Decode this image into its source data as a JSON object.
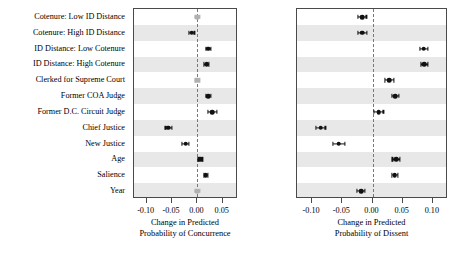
{
  "chart_data": {
    "type": "scatter",
    "title": "",
    "categories": [
      "Cotenure: Low ID Distance",
      "Cotenure: High ID Distance",
      "ID Distance: Low Cotenure",
      "ID Distance: High Cotenure",
      "Clerked for Supreme Court",
      "Former COA Judge",
      "Former D.C. Circuit Judge",
      "Chief Justice",
      "New Justice",
      "Age",
      "Salience",
      "Year"
    ],
    "panels": [
      {
        "name": "concurrence",
        "xlabel_lines": [
          "Change in Predicted",
          "Probability of Concurrence"
        ],
        "xlim": [
          -0.125,
          0.08
        ],
        "xticks": [
          -0.1,
          -0.05,
          0.0,
          0.05
        ],
        "xticklabels": [
          "-0.10",
          "-0.05",
          "0.00",
          "0.05"
        ],
        "zero_reference": 0.0,
        "points": [
          {
            "category": "Cotenure: Low ID Distance",
            "estimate": 0.0,
            "ci_low": -0.004,
            "ci_high": 0.004,
            "significant": false
          },
          {
            "category": "Cotenure: High ID Distance",
            "estimate": -0.011,
            "ci_low": -0.016,
            "ci_high": -0.006,
            "significant": true
          },
          {
            "category": "ID Distance: Low Cotenure",
            "estimate": 0.021,
            "ci_low": 0.016,
            "ci_high": 0.026,
            "significant": true
          },
          {
            "category": "ID Distance: High Cotenure",
            "estimate": 0.018,
            "ci_low": 0.013,
            "ci_high": 0.023,
            "significant": true
          },
          {
            "category": "Clerked for Supreme Court",
            "estimate": 0.0,
            "ci_low": -0.004,
            "ci_high": 0.004,
            "significant": false
          },
          {
            "category": "Former COA Judge",
            "estimate": 0.021,
            "ci_low": 0.016,
            "ci_high": 0.026,
            "significant": true
          },
          {
            "category": "Former D.C. Circuit Judge",
            "estimate": 0.029,
            "ci_low": 0.02,
            "ci_high": 0.038,
            "significant": true
          },
          {
            "category": "Chief Justice",
            "estimate": -0.057,
            "ci_low": -0.063,
            "ci_high": -0.051,
            "significant": true
          },
          {
            "category": "New Justice",
            "estimate": -0.023,
            "ci_low": -0.03,
            "ci_high": -0.016,
            "significant": true
          },
          {
            "category": "Age",
            "estimate": 0.006,
            "ci_low": 0.002,
            "ci_high": 0.01,
            "significant": true
          },
          {
            "category": "Salience",
            "estimate": 0.016,
            "ci_low": 0.012,
            "ci_high": 0.02,
            "significant": true
          },
          {
            "category": "Year",
            "estimate": 0.0,
            "ci_low": -0.004,
            "ci_high": 0.004,
            "significant": false
          }
        ]
      },
      {
        "name": "dissent",
        "xlabel_lines": [
          "Change in Predicted",
          "Probability of Dissent"
        ],
        "xlim": [
          -0.125,
          0.125
        ],
        "xticks": [
          -0.1,
          -0.05,
          0.0,
          0.05,
          0.1
        ],
        "xticklabels": [
          "-0.10",
          "-0.05",
          "0.00",
          "0.05",
          "0.10"
        ],
        "zero_reference": 0.0,
        "points": [
          {
            "category": "Cotenure: Low ID Distance",
            "estimate": -0.017,
            "ci_low": -0.024,
            "ci_high": -0.01,
            "significant": true
          },
          {
            "category": "Cotenure: High ID Distance",
            "estimate": -0.017,
            "ci_low": -0.024,
            "ci_high": -0.009,
            "significant": true
          },
          {
            "category": "ID Distance: Low Cotenure",
            "estimate": 0.085,
            "ci_low": 0.078,
            "ci_high": 0.092,
            "significant": true
          },
          {
            "category": "ID Distance: High Cotenure",
            "estimate": 0.086,
            "ci_low": 0.08,
            "ci_high": 0.092,
            "significant": true
          },
          {
            "category": "Clerked for Supreme Court",
            "estimate": 0.028,
            "ci_low": 0.02,
            "ci_high": 0.036,
            "significant": true
          },
          {
            "category": "Former COA Judge",
            "estimate": 0.038,
            "ci_low": 0.032,
            "ci_high": 0.044,
            "significant": true
          },
          {
            "category": "Former D.C. Circuit Judge",
            "estimate": 0.01,
            "ci_low": 0.002,
            "ci_high": 0.018,
            "significant": true
          },
          {
            "category": "Chief Justice",
            "estimate": -0.086,
            "ci_low": -0.094,
            "ci_high": -0.078,
            "significant": true
          },
          {
            "category": "New Justice",
            "estimate": -0.056,
            "ci_low": -0.066,
            "ci_high": -0.046,
            "significant": true
          },
          {
            "category": "Age",
            "estimate": 0.039,
            "ci_low": 0.033,
            "ci_high": 0.045,
            "significant": true
          },
          {
            "category": "Salience",
            "estimate": 0.037,
            "ci_low": 0.032,
            "ci_high": 0.042,
            "significant": true
          },
          {
            "category": "Year",
            "estimate": -0.019,
            "ci_low": -0.026,
            "ci_high": -0.012,
            "significant": true
          }
        ]
      }
    ],
    "ylabel": "",
    "grid": false,
    "legend": "none",
    "banding": "alternating-gray-rows"
  },
  "colors": {
    "point": "#111111",
    "point_faint": "#b0b0b0",
    "band": "#e8e8e8",
    "border": "#4a4a4a",
    "zeroline": "#777777",
    "background": "#ffffff"
  }
}
